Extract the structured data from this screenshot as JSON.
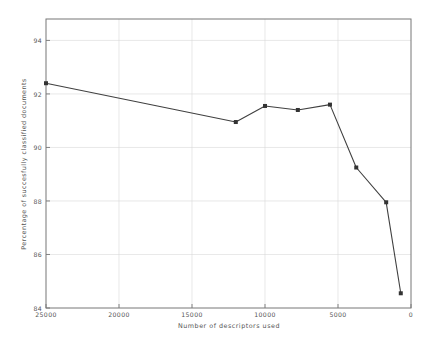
{
  "chart_data": {
    "type": "line",
    "title": "",
    "xlabel": "Number of descriptors used",
    "ylabel": "Percentage of succesfully classified documents",
    "xlim": [
      25000,
      0
    ],
    "ylim": [
      84,
      94.8
    ],
    "x_inverted": true,
    "grid": true,
    "legend": null,
    "legend_position": "none",
    "xticks": [
      25000,
      20000,
      15000,
      10000,
      5000,
      0
    ],
    "xtick_labels": [
      "25000",
      "20000",
      "15000",
      "10000",
      "5000",
      "0"
    ],
    "yticks": [
      84,
      86,
      88,
      90,
      92,
      94
    ],
    "ytick_labels": [
      "84",
      "86",
      "88",
      "90",
      "92",
      "94"
    ],
    "series": [
      {
        "name": "classification accuracy",
        "marker": "square",
        "color": "#404040",
        "x": [
          25000,
          12000,
          10000,
          7750,
          5550,
          3750,
          1700,
          700
        ],
        "y": [
          92.4,
          90.95,
          91.55,
          91.4,
          91.6,
          89.25,
          87.95,
          84.55
        ]
      }
    ]
  },
  "style": {
    "line_color": "#404040",
    "marker_color": "#333333",
    "axis_color": "#777777",
    "grid_color": "#d8d8d8",
    "background": "#ffffff",
    "text_color": "#555555"
  }
}
